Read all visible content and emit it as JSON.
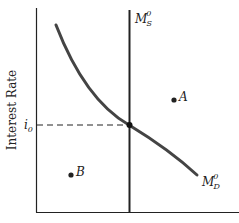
{
  "diagram": {
    "type": "money-market",
    "y_axis_label": "Interest Rate",
    "equilibrium_rate_label": {
      "base": "i",
      "sub": "0"
    },
    "supply_curve_label": {
      "base": "M",
      "sub": "S",
      "sup": "0"
    },
    "demand_curve_label": {
      "base": "M",
      "sub": "D",
      "sup": "0"
    },
    "points": [
      {
        "name": "A",
        "label": "A"
      },
      {
        "name": "B",
        "label": "B"
      }
    ],
    "colors": {
      "line": "#222222",
      "curve": "#444444",
      "background": "#ffffff"
    }
  }
}
